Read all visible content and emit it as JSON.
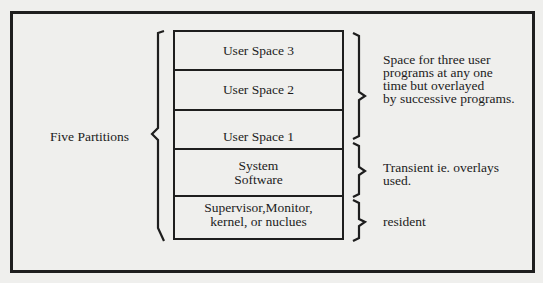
{
  "diagram": {
    "left_label": "Five Partitions",
    "partitions": [
      {
        "lines": [
          "User Space 3"
        ]
      },
      {
        "lines": [
          "User Space 2"
        ]
      },
      {
        "lines": [
          "User Space 1"
        ]
      },
      {
        "lines": [
          "System",
          "Software"
        ]
      },
      {
        "lines": [
          "Supervisor,Monitor,",
          "kernel, or nuclues"
        ]
      }
    ],
    "annotations": [
      {
        "lines": [
          "Space for three user",
          "programs at any one",
          "time but overlayed",
          "by successive programs."
        ]
      },
      {
        "lines": [
          "Transient ie. overlays",
          "used."
        ]
      },
      {
        "lines": [
          "resident"
        ]
      }
    ],
    "colors": {
      "background": "#efefed",
      "ink": "#1e1e1e"
    }
  }
}
